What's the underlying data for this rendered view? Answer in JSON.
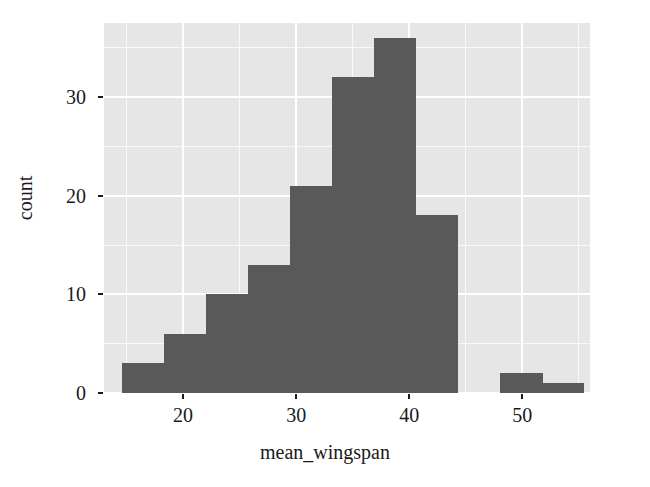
{
  "chart_data": {
    "type": "bar",
    "subtype": "histogram",
    "title": "",
    "xlabel": "mean_wingspan",
    "ylabel": "count",
    "xlim": [
      13.0,
      56.0
    ],
    "ylim": [
      0,
      37.5
    ],
    "xticks": [
      20,
      30,
      40,
      50
    ],
    "xticklabels": [
      "20",
      "30",
      "40",
      "50"
    ],
    "yticks": [
      0,
      10,
      20,
      30
    ],
    "yticklabels": [
      "0",
      "10",
      "20",
      "30"
    ],
    "x_minor_ticks": [
      15,
      25,
      35,
      45,
      55
    ],
    "y_minor_ticks": [
      5,
      15,
      25,
      35
    ],
    "grid": true,
    "legend": null,
    "bin_width": 3.72,
    "bins": [
      {
        "left": 14.6,
        "right": 18.3,
        "count": 3
      },
      {
        "left": 18.3,
        "right": 22.0,
        "count": 6
      },
      {
        "left": 22.0,
        "right": 25.7,
        "count": 10
      },
      {
        "left": 25.7,
        "right": 29.5,
        "count": 13
      },
      {
        "left": 29.5,
        "right": 33.2,
        "count": 21
      },
      {
        "left": 33.2,
        "right": 36.9,
        "count": 32
      },
      {
        "left": 36.9,
        "right": 40.6,
        "count": 36
      },
      {
        "left": 40.6,
        "right": 44.3,
        "count": 18
      },
      {
        "left": 44.3,
        "right": 48.0,
        "count": 0
      },
      {
        "left": 48.0,
        "right": 51.8,
        "count": 2
      },
      {
        "left": 51.8,
        "right": 55.5,
        "count": 1
      }
    ],
    "categories": [
      "14.6",
      "18.3",
      "22.0",
      "25.7",
      "29.5",
      "33.2",
      "36.9",
      "40.6",
      "44.3",
      "48.0",
      "51.8"
    ],
    "values": [
      3,
      6,
      10,
      13,
      21,
      32,
      36,
      18,
      0,
      2,
      1
    ]
  },
  "style": {
    "panel_background": "#e6e6e6",
    "grid_color": "#ffffff",
    "bar_color": "#595959",
    "text_color": "#1a1a1a",
    "figure_background": "#ffffff"
  }
}
